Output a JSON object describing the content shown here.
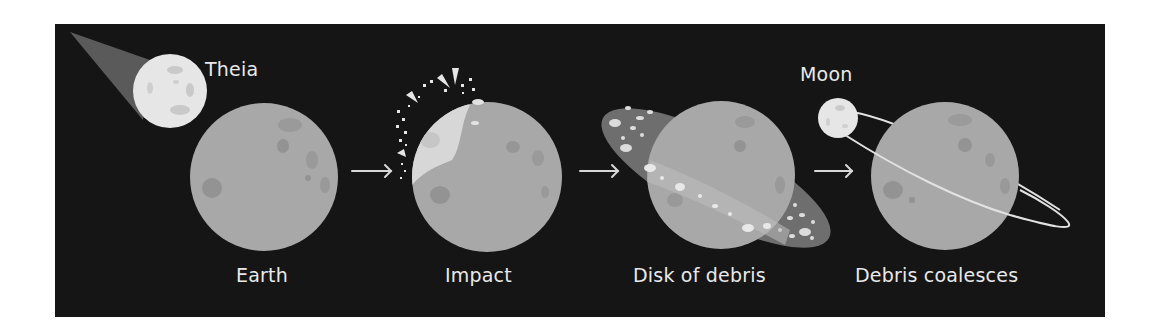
{
  "diagram": {
    "colors": {
      "background": "#151515",
      "planet": "#a8a8a8",
      "planet_spot": "#8f8f8f",
      "theia": "#e6e6e6",
      "theia_trail": "#5a5a5a",
      "debris_disk": "#6e6e6e",
      "debris_fleck": "#dcdcdc",
      "label": "#e9e9e9",
      "arrow": "#d8d8d8",
      "orbit": "#e2e2e2"
    },
    "stages": [
      {
        "id": "earth",
        "label": "Earth",
        "secondary_label": "Theia"
      },
      {
        "id": "impact",
        "label": "Impact"
      },
      {
        "id": "disk",
        "label": "Disk of debris"
      },
      {
        "id": "coalesce",
        "label": "Debris coalesces",
        "secondary_label": "Moon"
      }
    ],
    "arrows": [
      {
        "from": "earth",
        "to": "impact",
        "glyph": "arrow-right"
      },
      {
        "from": "impact",
        "to": "disk",
        "glyph": "arrow-right"
      },
      {
        "from": "disk",
        "to": "coalesce",
        "glyph": "arrow-right"
      }
    ]
  }
}
